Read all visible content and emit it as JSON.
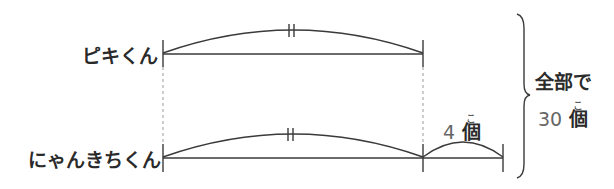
{
  "rows": [
    {
      "name": "ピキくん",
      "segment_label": ""
    },
    {
      "name": "にゃんきちくん",
      "segment_label": ""
    }
  ],
  "equal_mark": "||",
  "difference": {
    "value": "4",
    "unit": "個",
    "unit_reading": "こ"
  },
  "total": {
    "prefix": "全部で",
    "value": "30",
    "unit": "個",
    "unit_reading": "こ"
  },
  "colors": {
    "line": "#3a3a3a",
    "dashed": "#9a9a9a",
    "text": "#2a2a2a",
    "number": "#666666"
  }
}
